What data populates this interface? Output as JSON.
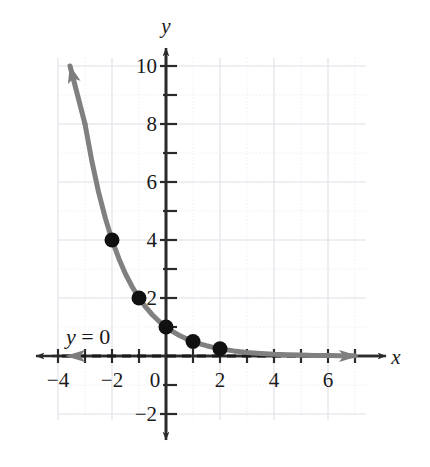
{
  "chart_data": {
    "type": "line",
    "title": "",
    "subtitle": "",
    "xlabel": "x",
    "ylabel": "y",
    "xlim": [
      -4.6,
      7.2
    ],
    "ylim": [
      -2.8,
      10.6
    ],
    "grid": true,
    "legend": false,
    "x_ticks_labeled": [
      -4,
      -2,
      0,
      2,
      4,
      6
    ],
    "y_ticks_labeled": [
      -2,
      2,
      4,
      6,
      8,
      10
    ],
    "x_tick_label_texts": [
      "−4",
      "−2",
      "0",
      "2",
      "4",
      "6"
    ],
    "y_tick_label_texts": [
      "−2",
      "2",
      "4",
      "6",
      "8",
      "10"
    ],
    "x_ticks_minor": [
      -4,
      -3,
      -2,
      -1,
      1,
      2,
      3,
      4,
      5,
      6,
      7
    ],
    "y_ticks_minor": [
      -2,
      -1,
      1,
      2,
      3,
      4,
      5,
      6,
      7,
      8,
      9,
      10
    ],
    "series": [
      {
        "name": "y = (1/2)^x",
        "type": "curve",
        "color": "#808080",
        "arrow_end": "start",
        "x": [
          -3.0,
          -2.75,
          -2.5,
          -2.25,
          -2.0,
          -1.75,
          -1.5,
          -1.25,
          -1.0,
          -0.75,
          -0.5,
          -0.25,
          0.0,
          0.25,
          0.5,
          0.75,
          1.0,
          1.25,
          1.5,
          1.75,
          2.0,
          2.5,
          3.0,
          3.5,
          4.0,
          4.5,
          5.0,
          5.5,
          6.0,
          6.5,
          7.0
        ],
        "y": [
          8.0,
          6.727,
          5.657,
          4.757,
          4.0,
          3.364,
          2.828,
          2.378,
          2.0,
          1.682,
          1.414,
          1.189,
          1.0,
          0.841,
          0.707,
          0.595,
          0.5,
          0.42,
          0.354,
          0.297,
          0.25,
          0.177,
          0.125,
          0.088,
          0.063,
          0.044,
          0.031,
          0.022,
          0.016,
          0.011,
          0.008
        ]
      }
    ],
    "points": [
      {
        "label": "(-2, 4)",
        "x": -2,
        "y": 4
      },
      {
        "label": "(-1, 2)",
        "x": -1,
        "y": 2
      },
      {
        "label": "(0, 1)",
        "x": 0,
        "y": 1
      },
      {
        "label": "(1, 0.5)",
        "x": 1,
        "y": 0.5
      },
      {
        "label": "(2, 0.25)",
        "x": 2,
        "y": 0.25
      }
    ],
    "annotations": [
      {
        "name": "horizontal-asymptote",
        "text_prefix": "y",
        "text_suffix": " = 0",
        "full_text": "y = 0",
        "value": 0,
        "style": "dashed",
        "color": "#1a1a1a"
      }
    ],
    "colors": {
      "curve": "#808080",
      "points": "#111111",
      "axes": "#2b2b2b",
      "grid_minor": "#e9e9ef",
      "grid_major": "#dedee8",
      "asymptote": "#1a1a1a",
      "background": "#ffffff"
    }
  }
}
